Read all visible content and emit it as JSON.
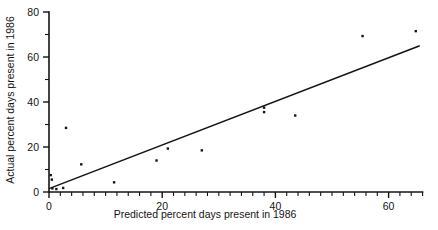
{
  "chart_data": {
    "type": "scatter",
    "title": "",
    "xlabel": "Predicted percent days present in 1986",
    "ylabel": "Actual percent days present in 1986",
    "xlim": [
      0,
      66
    ],
    "ylim": [
      0,
      80
    ],
    "grid": false,
    "legend": "none",
    "x_ticks_major": [
      0,
      20,
      40,
      60
    ],
    "x_tick_labels": [
      "0",
      "20",
      "40",
      "60"
    ],
    "x_ticks_minor_step": 2,
    "y_ticks_major": [
      0,
      20,
      40,
      60,
      80
    ],
    "y_tick_labels": [
      "0",
      "20",
      "40",
      "60",
      "80"
    ],
    "y_ticks_minor_step": 10,
    "marker": "filled-square-dot",
    "points": [
      {
        "x": 0.3,
        "y": 7.5
      },
      {
        "x": 0.5,
        "y": 5.5
      },
      {
        "x": 0.6,
        "y": 1.6
      },
      {
        "x": 1.3,
        "y": 1.3
      },
      {
        "x": 2.5,
        "y": 1.8
      },
      {
        "x": 3.0,
        "y": 28.5
      },
      {
        "x": 5.7,
        "y": 12.3
      },
      {
        "x": 11.5,
        "y": 4.3
      },
      {
        "x": 19.0,
        "y": 14.0
      },
      {
        "x": 21.0,
        "y": 19.3
      },
      {
        "x": 27.0,
        "y": 18.5
      },
      {
        "x": 38.0,
        "y": 37.5
      },
      {
        "x": 38.0,
        "y": 35.5
      },
      {
        "x": 43.5,
        "y": 34.0
      },
      {
        "x": 55.4,
        "y": 69.3
      },
      {
        "x": 64.8,
        "y": 71.5
      }
    ],
    "fit_line": {
      "type": "linear-regression",
      "x_start": 0.0,
      "y_start": 1.5,
      "x_end": 65.5,
      "y_end": 65.0
    },
    "colors": {
      "ink": "#141414",
      "background": "#ffffff",
      "point": "#141414",
      "line": "#141414"
    }
  }
}
